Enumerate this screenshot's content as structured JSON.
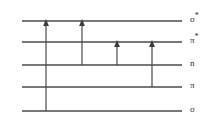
{
  "diagram": {
    "type": "molecular-orbital-energy-level-diagram",
    "line_color": "#4a4a4a",
    "arrow_color": "#3c3c3c",
    "background_color": "#ffffff",
    "levels": [
      {
        "id": "sigma-star",
        "label": "σ",
        "star": "*",
        "full_label": "σ*",
        "y": 21,
        "x_start": 22,
        "x_end": 182,
        "label_x": 190,
        "label_y": 16
      },
      {
        "id": "pi-star",
        "label": "π",
        "star": "*",
        "full_label": "π*",
        "y": 42,
        "x_start": 22,
        "x_end": 182,
        "label_x": 190,
        "label_y": 37
      },
      {
        "id": "n",
        "label": "n",
        "star": "",
        "full_label": "n",
        "y": 65,
        "x_start": 22,
        "x_end": 182,
        "label_x": 190,
        "label_y": 60
      },
      {
        "id": "pi",
        "label": "π",
        "star": "",
        "full_label": "π",
        "y": 87,
        "x_start": 22,
        "x_end": 182,
        "label_x": 190,
        "label_y": 82
      },
      {
        "id": "sigma",
        "label": "σ",
        "star": "",
        "full_label": "σ",
        "y": 111,
        "x_start": 22,
        "x_end": 182,
        "label_x": 190,
        "label_y": 105
      }
    ],
    "transitions": [
      {
        "id": "sigma-to-sigma-star",
        "name": "σ → σ*",
        "from": "sigma",
        "to": "sigma-star",
        "x": 46,
        "y_from": 111,
        "y_to": 21
      },
      {
        "id": "n-to-sigma-star",
        "name": "n → σ*",
        "from": "n",
        "to": "sigma-star",
        "x": 82,
        "y_from": 65,
        "y_to": 21
      },
      {
        "id": "n-to-pi-star",
        "name": "n → π*",
        "from": "n",
        "to": "pi-star",
        "x": 117,
        "y_from": 65,
        "y_to": 42
      },
      {
        "id": "pi-to-pi-star",
        "name": "π → π*",
        "from": "pi",
        "to": "pi-star",
        "x": 152,
        "y_from": 87,
        "y_to": 42
      }
    ]
  }
}
